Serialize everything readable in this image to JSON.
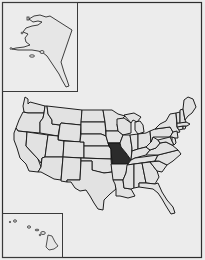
{
  "map": {
    "subject": "United States outline map",
    "highlighted_state": "Missouri",
    "colors": {
      "background": "#ececec",
      "state_fill": "#e2e2e2",
      "state_border": "#1e1e1e",
      "highlight_fill": "#2b2b2b"
    },
    "insets": [
      {
        "name": "Alaska",
        "position": "top-left"
      },
      {
        "name": "Hawaii",
        "position": "bottom-left"
      }
    ],
    "labels": []
  }
}
